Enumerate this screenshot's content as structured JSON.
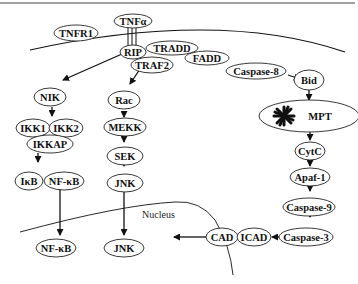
{
  "diagram": {
    "membrane_label": "",
    "nucleus_label": "Nucleus",
    "nodes": {
      "tnfa": "TNFα",
      "tnfr1": "TNFR1",
      "rip": "RIP",
      "tradd": "TRADD",
      "traf2": "TRAF2",
      "fadd": "FADD",
      "caspase8": "Caspase-8",
      "bid": "Bid",
      "nik": "NIK",
      "ikk1": "IKK1",
      "ikk2": "IKK2",
      "ikkap": "IKKAP",
      "ikb": "IκB",
      "nfkb_cyto": "NF-κB",
      "nfkb_nuc": "NF-κB",
      "rac": "Rac",
      "mekk": "MEKK",
      "sek": "SEK",
      "jnk_cyto": "JNK",
      "jnk_nuc": "JNK",
      "mpt": "MPT",
      "cytc": "CytC",
      "apaf1": "Apaf-1",
      "caspase9": "Caspase-9",
      "caspase3": "Caspase-3",
      "cad": "CAD",
      "icad": "ICAD"
    },
    "edges": [
      [
        "RIP",
        "NIK"
      ],
      [
        "TRAF2",
        "Rac"
      ],
      [
        "Caspase-8",
        "Bid"
      ],
      [
        "Bid",
        "MPT"
      ],
      [
        "NIK",
        "IKK1/IKK2/IKKAP"
      ],
      [
        "IKKAP",
        "IκB/NF-κB"
      ],
      [
        "NF-κB",
        "NF-κB (nucleus)"
      ],
      [
        "Rac",
        "MEKK"
      ],
      [
        "MEKK",
        "SEK"
      ],
      [
        "SEK",
        "JNK"
      ],
      [
        "JNK",
        "JNK (nucleus)"
      ],
      [
        "MPT",
        "CytC"
      ],
      [
        "CytC",
        "Apaf-1"
      ],
      [
        "Apaf-1",
        "Caspase-9"
      ],
      [
        "Caspase-9",
        "Caspase-3"
      ],
      [
        "Caspase-3",
        "CAD/ICAD"
      ],
      [
        "CAD/ICAD",
        "Nucleus"
      ]
    ],
    "colors": {
      "stroke": "#111111",
      "background": "#ffffff"
    }
  }
}
